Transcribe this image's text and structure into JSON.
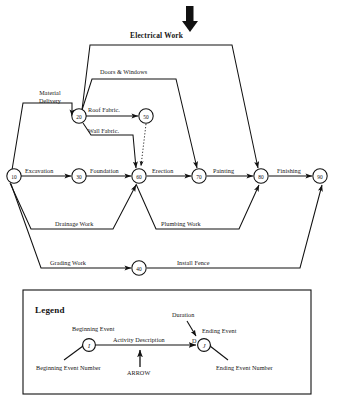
{
  "diagram": {
    "title_arrow": "thick-down-arrow",
    "nodes": [
      {
        "id": "n10",
        "label": "10",
        "x": 14,
        "y": 176
      },
      {
        "id": "n20",
        "label": "20",
        "x": 79,
        "y": 116
      },
      {
        "id": "n30",
        "label": "30",
        "x": 79,
        "y": 176
      },
      {
        "id": "n40",
        "label": "40",
        "x": 139,
        "y": 268
      },
      {
        "id": "n50",
        "label": "50",
        "x": 146,
        "y": 116
      },
      {
        "id": "n60",
        "label": "60",
        "x": 139,
        "y": 176
      },
      {
        "id": "n70",
        "label": "70",
        "x": 199,
        "y": 176
      },
      {
        "id": "n80",
        "label": "80",
        "x": 261,
        "y": 176
      },
      {
        "id": "n90",
        "label": "90",
        "x": 320,
        "y": 176
      }
    ],
    "activities": [
      {
        "name": "electrical-work",
        "label": "Electrical Work",
        "from": "20",
        "to": "80",
        "bold": true
      },
      {
        "name": "doors-and-windows",
        "label": "Doors & Windows",
        "from": "20",
        "to": "70"
      },
      {
        "name": "material-delivery",
        "label": "Material\nDelivery",
        "from": "10",
        "to": "20"
      },
      {
        "name": "roof-fabric",
        "label": "Roof Fabric.",
        "from": "20",
        "to": "50"
      },
      {
        "name": "wall-fabric",
        "label": "Wall Fabric.",
        "from": "20",
        "to": "60"
      },
      {
        "name": "excavation",
        "label": "Excavation",
        "from": "10",
        "to": "30"
      },
      {
        "name": "foundation",
        "label": "Foundation",
        "from": "30",
        "to": "60"
      },
      {
        "name": "erection",
        "label": "Erection",
        "from": "60",
        "to": "70"
      },
      {
        "name": "painting",
        "label": "Painting",
        "from": "70",
        "to": "80"
      },
      {
        "name": "finishing",
        "label": "Finishing",
        "from": "80",
        "to": "90"
      },
      {
        "name": "drainage-work",
        "label": "Drainage Work",
        "from": "10",
        "to": "60"
      },
      {
        "name": "plumbing-work",
        "label": "Plumbing Work",
        "from": "60",
        "to": "80"
      },
      {
        "name": "grading-work",
        "label": "Grading Work",
        "from": "10",
        "to": "40"
      },
      {
        "name": "install-fence",
        "label": "Install Fence",
        "from": "40",
        "to": "90"
      },
      {
        "name": "dummy-50-60",
        "label": "",
        "from": "50",
        "to": "60",
        "style": "dotted"
      }
    ],
    "labels": {
      "electrical_work": "Electrical Work",
      "doors_windows": "Doors & Windows",
      "material_delivery_1": "Material",
      "material_delivery_2": "Delivery",
      "roof_fabric": "Roof Fabric.",
      "wall_fabric": "Wall Fabric.",
      "excavation": "Excavation",
      "foundation": "Foundation",
      "erection": "Erection",
      "painting": "Painting",
      "finishing": "Finishing",
      "drainage_work": "Drainage Work",
      "plumbing_work": "Plumbing Work",
      "grading_work": "Grading Work",
      "install_fence": "Install Fence"
    }
  },
  "legend": {
    "title": "Legend",
    "beginning_event": "Beginning Event",
    "beginning_event_number": "Beginning Event Number",
    "activity_description": "Activity Description",
    "arrow": "ARROW",
    "duration": "Duration",
    "duration_symbol": "D",
    "ending_event": "Ending Event",
    "ending_event_number": "Ending Event Number",
    "node_i": "I",
    "node_j": "J"
  },
  "colors": {
    "ink": "#111111",
    "paper": "#ffffff"
  }
}
